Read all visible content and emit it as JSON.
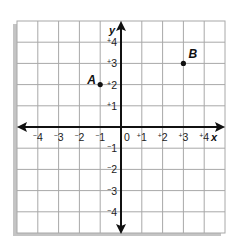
{
  "graph": {
    "grid": {
      "cols": 10,
      "rows": 10,
      "line_color": "#a8a8a8",
      "shadow_color": "#c4c4c4"
    },
    "axes": {
      "x_label": "x",
      "y_label": "y",
      "color": "#111111"
    },
    "x_ticks": [
      {
        "value": -4,
        "sign": "−",
        "num": "4"
      },
      {
        "value": -3,
        "sign": "−",
        "num": "3"
      },
      {
        "value": -2,
        "sign": "−",
        "num": "2"
      },
      {
        "value": -1,
        "sign": "−",
        "num": "1"
      },
      {
        "value": 0,
        "sign": "",
        "num": "0"
      },
      {
        "value": 1,
        "sign": "+",
        "num": "1"
      },
      {
        "value": 2,
        "sign": "+",
        "num": "2"
      },
      {
        "value": 3,
        "sign": "+",
        "num": "3"
      },
      {
        "value": 4,
        "sign": "+",
        "num": "4"
      }
    ],
    "y_ticks": [
      {
        "value": 4,
        "sign": "+",
        "num": "4"
      },
      {
        "value": 3,
        "sign": "+",
        "num": "3"
      },
      {
        "value": 2,
        "sign": "+",
        "num": "2"
      },
      {
        "value": 1,
        "sign": "+",
        "num": "1"
      },
      {
        "value": -1,
        "sign": "−",
        "num": "1"
      },
      {
        "value": -2,
        "sign": "−",
        "num": "2"
      },
      {
        "value": -3,
        "sign": "−",
        "num": "3"
      },
      {
        "value": -4,
        "sign": "−",
        "num": "4"
      }
    ],
    "points": [
      {
        "label": "A",
        "x": -1,
        "y": 2
      },
      {
        "label": "B",
        "x": 3,
        "y": 3
      }
    ]
  }
}
